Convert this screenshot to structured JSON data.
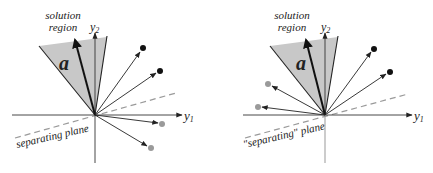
{
  "panels": [
    {
      "id": "left",
      "solution_label_line1": "solution",
      "solution_label_line2": "region",
      "vector_label": "a",
      "axis_x_label": "y",
      "axis_x_sub": "1",
      "axis_y_label": "y",
      "axis_y_sub": "2",
      "plane_label": "separating plane",
      "origin": [
        95,
        115
      ],
      "black_points": [
        [
          143,
          49
        ],
        [
          160,
          71
        ]
      ],
      "gray_points": [
        [
          162,
          124
        ],
        [
          151,
          148
        ]
      ]
    },
    {
      "id": "right",
      "solution_label_line1": "solution",
      "solution_label_line2": "region",
      "vector_label": "a",
      "axis_x_label": "y",
      "axis_x_sub": "1",
      "axis_y_label": "y",
      "axis_y_sub": "2",
      "plane_label": "\"separating\" plane",
      "origin": [
        325,
        115
      ],
      "black_points": [
        [
          374,
          49
        ],
        [
          390,
          72
        ]
      ],
      "gray_points": [
        [
          268,
          84
        ],
        [
          258,
          107
        ]
      ]
    }
  ],
  "colors": {
    "region_fill": "#c8c8c8",
    "black_point": "#111111",
    "gray_point": "#9a9a9a",
    "dashed_plane": "#9a9a9a",
    "axis": "#333333"
  }
}
